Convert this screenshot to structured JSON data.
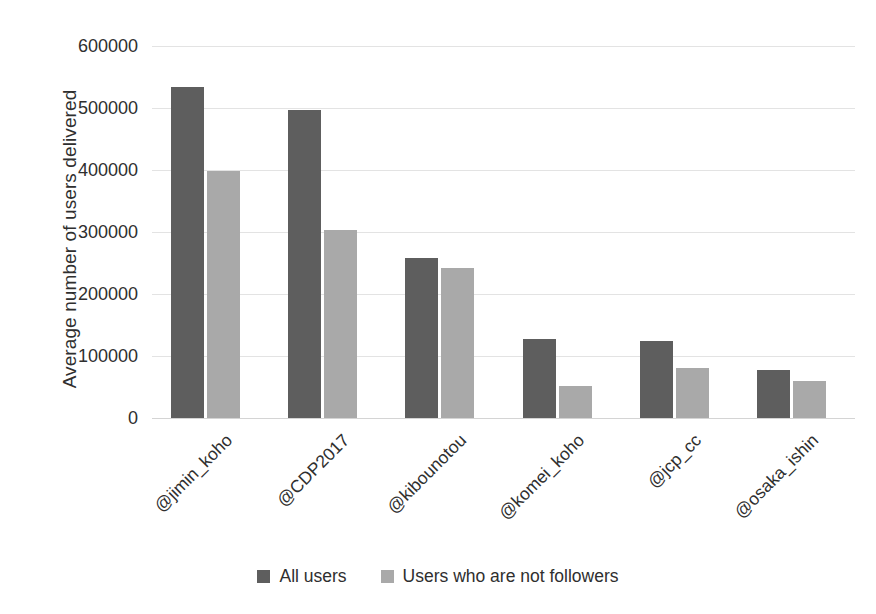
{
  "chart_data": {
    "type": "bar",
    "title": "",
    "xlabel": "",
    "ylabel": "Average number of users delivered",
    "ylim": [
      0,
      600000
    ],
    "ytick_values": [
      600000,
      500000,
      400000,
      300000,
      200000,
      100000,
      0
    ],
    "ytick_labels": [
      "600000",
      "500000",
      "400000",
      "300000",
      "200000",
      "100000",
      "0"
    ],
    "grid": true,
    "legend_position": "bottom",
    "categories": [
      "@jimin_koho",
      "@CDP2017",
      "@kibounotou",
      "@komei_koho",
      "@jcp_cc",
      "@osaka_ishin"
    ],
    "series": [
      {
        "name": "All users",
        "color": "#5e5e5e",
        "values": [
          534000,
          496000,
          258000,
          128000,
          125000,
          77000
        ]
      },
      {
        "name": "Users who are not followers",
        "color": "#a9a9a9",
        "values": [
          399000,
          304000,
          242000,
          51000,
          81000,
          60000
        ]
      }
    ]
  },
  "legend": {
    "items": [
      {
        "label": "All users",
        "color": "#5e5e5e"
      },
      {
        "label": "Users who are not followers",
        "color": "#a9a9a9"
      }
    ]
  }
}
